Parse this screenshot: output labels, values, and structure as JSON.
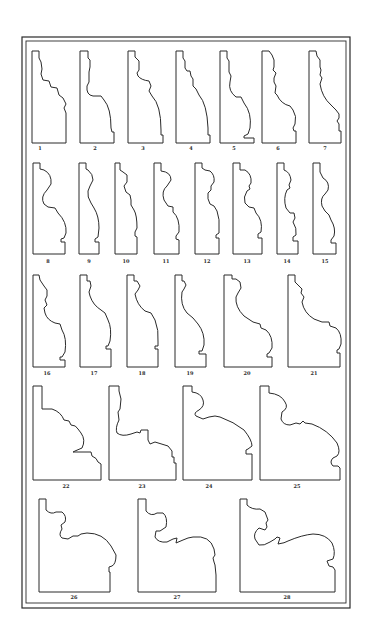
{
  "plate": {
    "ink_color": "#2a2a2a",
    "paper_color": "#ffffff",
    "border": {
      "outer": {
        "x": 22,
        "y": 37,
        "w": 328,
        "h": 571
      },
      "inner": {
        "x": 26,
        "y": 41,
        "w": 320,
        "h": 562
      }
    },
    "profiles": [
      {
        "id": "1",
        "label": "1",
        "lx": 40,
        "ly": 147,
        "d": "M32,51 L39,51 L39,58 L41,62 L42,69 L41,74 L43,80 L49,81 L51,87 L57,88 L59,95 L63,98 L66,104 L64,108 L66,113 L66,143 L32,143 Z"
      },
      {
        "id": "2",
        "label": "2",
        "lx": 95,
        "ly": 147,
        "d": "M80,51 L88,51 L88,58 L90,60 L90,67 L89,72 L89,82 L87,86 Q86,95 93,96 L101,96 L104,100 Q111,108 111,128 L112,132 L114,132 L114,143 L80,143 Z"
      },
      {
        "id": "3",
        "label": "3",
        "lx": 143,
        "ly": 147,
        "d": "M128,51 L135,51 L135,57 L139,61 L139,70 L137,73 L138,76 Q141,80 149,81 L151,86 L149,91 L152,96 Q161,105 161,130 L161,135 L163,135 L163,143 L128,143 Z"
      },
      {
        "id": "4",
        "label": "4",
        "lx": 191,
        "ly": 147,
        "d": "M176,51 L183,51 L183,58 L185,61 L185,68 L187,71 L190,71 L191,76 L193,79 L193,86 L196,89 L199,95 Q207,104 208,128 L208,135 L210,135 L210,143 L176,143 Z"
      },
      {
        "id": "5",
        "label": "5",
        "lx": 234,
        "ly": 147,
        "d": "M220,51 L227,51 L227,58 L229,61 L229,72 L231,76 L230,82 Q228,91 236,97 L241,97 L244,103 Q252,113 250,128 L248,134 L244,136 L244,138 L254,138 L254,143 L220,143 Z"
      },
      {
        "id": "6",
        "label": "6",
        "lx": 278,
        "ly": 147,
        "d": "M262,51 L269,51 L272,55 L274,60 L274,67 L273,70 L276,73 L274,78 L274,82 L276,86 L275,93 L277,95 Q281,104 290,106 L293,110 Q297,116 295,124 L293,128 L294,131 L296,131 L296,143 L262,143 Z"
      },
      {
        "id": "7",
        "label": "7",
        "lx": 325,
        "ly": 147,
        "d": "M309,51 L316,51 L317,56 L320,60 L320,67 L321,70 L320,75 L322,78 L320,84 Q322,97 331,105 L336,110 L339,114 L339,118 L337,121 L339,124 L339,131 L341,131 L341,143 L309,143 Z"
      },
      {
        "id": "8",
        "label": "8",
        "lx": 48,
        "ly": 260,
        "d": "M33,163 L40,163 L40,169 L44,170 Q52,174 51,184 L47,190 Q40,197 44,204 L48,207 L55,208 L58,213 Q67,222 66,233 L64,238 L61,239 L61,242 L65,242 L65,254 L33,254 Z"
      },
      {
        "id": "9",
        "label": "9",
        "lx": 89,
        "ly": 260,
        "d": "M79,163 L86,163 L86,169 L88,170 Q93,174 93,180 L90,186 L88,191 Q87,197 91,203 L94,208 Q99,216 99,228 L98,237 L95,239 L95,242 L99,242 L99,254 L79,254 Z"
      },
      {
        "id": "10",
        "label": "10",
        "lx": 126,
        "ly": 260,
        "d": "M115,163 L120,163 L120,170 L123,172 L127,175 L127,182 L124,186 L126,192 L130,195 L131,200 L131,205 L134,210 Q137,215 137,228 L135,232 L135,236 L137,237 L137,254 L115,254 Z"
      },
      {
        "id": "11",
        "label": "11",
        "lx": 166,
        "ly": 260,
        "d": "M154,163 L161,163 L161,171 Q171,172 171,180 L167,186 Q161,191 164,200 L168,206 L173,207 L173,212 Q180,218 179,232 L176,236 L176,239 L179,240 L179,254 L154,254 Z"
      },
      {
        "id": "12",
        "label": "12",
        "lx": 207,
        "ly": 260,
        "d": "M195,163 L202,163 L202,168 L205,170 L210,171 Q215,175 214,182 L211,186 L211,190 L208,193 Q207,199 210,204 L214,206 L217,211 Q220,220 219,228 L219,233 L216,235 L216,238 L219,238 L219,254 L195,254 Z"
      },
      {
        "id": "13",
        "label": "13",
        "lx": 247,
        "ly": 260,
        "d": "M233,163 L240,163 L240,170 L245,170 Q252,174 251,183 L249,186 L250,189 L247,191 Q243,197 245,203 L249,207 L254,208 L256,213 Q263,220 261,232 L258,234 L258,238 L262,238 L262,254 L233,254 Z"
      },
      {
        "id": "14",
        "label": "14",
        "lx": 287,
        "ly": 260,
        "d": "M277,163 L284,163 L284,170 Q290,172 291,180 L289,185 L290,188 L287,190 Q283,198 286,208 L290,213 L294,213 L295,218 L293,222 Q297,228 296,235 L293,237 L293,241 L298,241 L298,254 L277,254 Z"
      },
      {
        "id": "15",
        "label": "15",
        "lx": 325,
        "ly": 260,
        "d": "M313,163 L320,163 L320,172 L323,178 Q330,182 328,190 L325,194 Q320,198 322,206 L325,211 L329,215 L331,220 Q336,228 334,236 L331,240 L331,243 L336,243 L336,254 L313,254 Z"
      },
      {
        "id": "16",
        "label": "16",
        "lx": 47,
        "ly": 372,
        "d": "M33,275 L39,275 L40,280 L44,286 L47,290 L47,296 L45,300 L47,305 L44,308 L45,313 Q47,320 55,323 L60,324 L62,330 Q67,338 65,352 L62,357 L60,357 L60,360 L65,360 L65,367 L33,367 Z"
      },
      {
        "id": "17",
        "label": "17",
        "lx": 94,
        "ly": 372,
        "d": "M80,275 L87,275 L87,281 L90,281 L91,286 L89,292 L90,296 Q93,305 101,310 L105,313 L108,320 Q112,328 110,341 L108,346 L106,346 L106,349 L111,349 L111,367 L80,367 Z"
      },
      {
        "id": "18",
        "label": "18",
        "lx": 142,
        "ly": 372,
        "d": "M127,275 L134,275 L134,281 L137,281 L140,286 L138,290 L135,294 Q137,305 145,311 L151,313 L155,320 Q159,330 158,342 L158,346 L155,346 L155,349 L158,349 L158,367 L127,367 Z"
      },
      {
        "id": "19",
        "label": "19",
        "lx": 190,
        "ly": 372,
        "d": "M175,275 L182,275 L182,281 L184,281 L186,285 L184,289 L182,292 Q180,305 187,313 L193,318 L198,324 Q205,333 204,345 L202,351 L199,351 L199,354 L206,354 L206,367 L175,367 Z"
      },
      {
        "id": "20",
        "label": "20",
        "lx": 247,
        "ly": 372,
        "d": "M224,275 L232,275 L232,279 L236,279 L240,282 L241,288 L238,293 L236,297 Q235,307 244,316 L253,322 L260,324 L261,328 L266,330 Q273,336 272,348 L269,353 L267,354 L267,357 L272,357 L272,367 L224,367 Z"
      },
      {
        "id": "21",
        "label": "21",
        "lx": 314,
        "ly": 372,
        "d": "M288,275 L295,275 L295,282 L298,285 L302,289 L301,293 L304,297 L302,302 Q304,313 314,319 L322,322 L329,322 L330,326 L336,328 Q342,333 341,344 L339,349 L337,350 L337,353 L340,353 L340,367 L288,367 Z"
      },
      {
        "id": "22",
        "label": "22",
        "lx": 66,
        "ly": 485,
        "d": "M33,386 L42,386 L42,409 L52,409 Q61,412 64,420 L69,421 L71,425 Q76,425 78,429 L81,433 Q86,440 82,448 L75,451 L73,452 L91,452 L92,456 Q97,458 98,462 L101,464 L101,480 L33,480 Z"
      },
      {
        "id": "23",
        "label": "23",
        "lx": 142,
        "ly": 485,
        "d": "M109,386 L119,386 L119,391 L121,399 L120,409 L118,412 L119,420 Q115,428 117,433 Q122,437 131,434 L137,432 L140,433 L141,430 L148,430 L148,440 L150,444 L155,442 L168,446 L172,451 L172,457 L174,457 L174,463 L176,463 L176,480 L109,480 Z"
      },
      {
        "id": "24",
        "label": "24",
        "lx": 209,
        "ly": 485,
        "d": "M183,386 L192,386 L192,392 Q201,393 203,400 Q205,406 199,410 Q193,413 196,416 L203,419 L209,417 L215,416 L220,417 Q234,422 244,430 Q252,440 252,446 L248,449 L246,450 L246,454 L252,454 L252,480 L183,480 Z"
      },
      {
        "id": "25",
        "label": "25",
        "lx": 297,
        "ly": 485,
        "d": "M260,386 L269,386 L269,393 Q281,394 285,402 Q289,408 282,412 L281,419 Q283,425 290,425 L296,423 L300,424 L303,421 L305,423 L312,424 Q328,430 337,443 Q341,452 337,456 L333,458 Q329,462 333,466 L338,466 L340,468 L340,480 L260,480 Z"
      },
      {
        "id": "26",
        "label": "26",
        "lx": 74,
        "ly": 596,
        "d": "M39,499 L46,499 L46,510 Q51,515 56,512 L62,512 Q67,516 65,522 L61,525 L62,529 Q58,535 62,538 L68,539 L73,536 L78,536 L81,534 L87,533 Q103,533 111,546 L116,555 Q116,564 112,566 L109,567 L109,572 L110,572 L110,592 L39,592 Z"
      },
      {
        "id": "27",
        "label": "27",
        "lx": 177,
        "ly": 596,
        "d": "M138,499 L146,499 L146,511 Q151,517 157,513 L163,513 Q168,517 166,527 L160,531 L156,531 L155,537 Q158,543 167,542 L173,539 L177,538 L176,543 L183,540 L188,538 L193,537 Q210,535 214,549 L215,555 L213,558 L214,562 L215,565 L216,575 L216,592 L138,592 Z"
      },
      {
        "id": "28",
        "label": "28",
        "lx": 287,
        "ly": 596,
        "d": "M240,499 L247,499 L247,505 Q252,510 260,509 L265,512 L268,520 L266,523 L267,527 L265,530 L259,528 Q253,533 255,539 L259,545 Q264,546 270,542 L275,539 L277,537 L280,538 L278,544 Q285,543 288,541 Q302,535 313,534 Q326,534 332,543 Q336,552 333,559 L327,561 L329,566 L333,567 L335,570 L335,592 L240,592 Z"
      }
    ]
  }
}
